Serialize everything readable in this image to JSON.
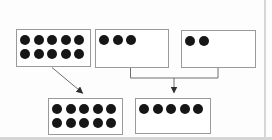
{
  "diagram": {
    "background_color": "#fdfdfd",
    "box_fill": "#ffffff",
    "box_border_color": "#9a9a9a",
    "dot_color": "#161616",
    "line_color": "#6e6e6e",
    "arrowhead_color": "#2f2f2f",
    "page_edge_color": "#d6d6d6",
    "boxes": [
      {
        "id": "top-left",
        "total_dots": 10,
        "dot_rows": [
          5,
          5
        ],
        "x": 16,
        "y": 29,
        "w": 75,
        "h": 38
      },
      {
        "id": "top-middle",
        "total_dots": 3,
        "dot_rows": [
          3
        ],
        "x": 95,
        "y": 29,
        "w": 74,
        "h": 39
      },
      {
        "id": "top-right",
        "total_dots": 2,
        "dot_rows": [
          2
        ],
        "x": 181,
        "y": 30,
        "w": 75,
        "h": 38
      },
      {
        "id": "bottom-left",
        "total_dots": 10,
        "dot_rows": [
          5,
          5
        ],
        "x": 48,
        "y": 98,
        "w": 75,
        "h": 37
      },
      {
        "id": "bottom-right",
        "total_dots": 5,
        "dot_rows": [
          5
        ],
        "x": 135,
        "y": 98,
        "w": 76,
        "h": 36
      }
    ],
    "connectors": [
      {
        "id": "arrow-top-left-to-bottom-left",
        "type": "arrow",
        "points": [
          [
            52,
            67.5
          ],
          [
            82.5,
            93
          ]
        ]
      },
      {
        "id": "bracket-middle-and-right",
        "type": "polyline",
        "points": [
          [
            130.5,
            67.5
          ],
          [
            130.5,
            78
          ],
          [
            218,
            78
          ],
          [
            218,
            67.5
          ]
        ]
      },
      {
        "id": "arrow-bracket-to-bottom-right",
        "type": "arrow",
        "points": [
          [
            174,
            78
          ],
          [
            174,
            92.5
          ]
        ]
      }
    ]
  }
}
